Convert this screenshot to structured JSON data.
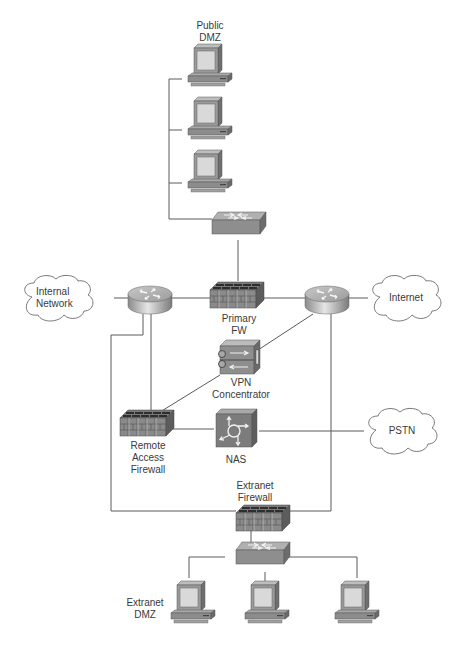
{
  "diagram": {
    "type": "network-topology",
    "colors": {
      "line": "#5a5a5a",
      "device_dark": "#6e6e6e",
      "device_mid": "#8c8c8c",
      "device_light": "#b8b8b8",
      "screen": "#d9d9d9",
      "cloud_stroke": "#6a6a6a"
    },
    "labels": {
      "public_dmz": "Public\nDMZ",
      "internal_network": "Internal\nNetwork",
      "internet": "Internet",
      "primary_fw": "Primary\nFW",
      "vpn_concentrator": "VPN\nConcentrator",
      "remote_access_firewall": "Remote\nAccess\nFirewall",
      "nas": "NAS",
      "pstn": "PSTN",
      "extranet_firewall": "Extranet\nFirewall",
      "extranet_dmz": "Extranet\nDMZ"
    },
    "nodes": [
      {
        "id": "public-dmz-pc-1",
        "kind": "workstation"
      },
      {
        "id": "public-dmz-pc-2",
        "kind": "workstation"
      },
      {
        "id": "public-dmz-pc-3",
        "kind": "workstation"
      },
      {
        "id": "public-dmz-switch",
        "kind": "switch"
      },
      {
        "id": "internal-network",
        "kind": "cloud",
        "label": "Internal Network"
      },
      {
        "id": "internal-router",
        "kind": "router"
      },
      {
        "id": "primary-fw",
        "kind": "firewall",
        "label": "Primary FW"
      },
      {
        "id": "internet-router",
        "kind": "router"
      },
      {
        "id": "internet",
        "kind": "cloud",
        "label": "Internet"
      },
      {
        "id": "vpn-concentrator",
        "kind": "vpn-concentrator",
        "label": "VPN Concentrator"
      },
      {
        "id": "remote-access-firewall",
        "kind": "firewall",
        "label": "Remote Access Firewall"
      },
      {
        "id": "nas",
        "kind": "access-server",
        "label": "NAS"
      },
      {
        "id": "pstn",
        "kind": "cloud",
        "label": "PSTN"
      },
      {
        "id": "extranet-firewall",
        "kind": "firewall",
        "label": "Extranet Firewall"
      },
      {
        "id": "extranet-switch",
        "kind": "switch"
      },
      {
        "id": "extranet-dmz-pc-1",
        "kind": "workstation"
      },
      {
        "id": "extranet-dmz-pc-2",
        "kind": "workstation"
      },
      {
        "id": "extranet-dmz-pc-3",
        "kind": "workstation"
      }
    ],
    "edges": [
      [
        "public-dmz-pc-1",
        "public-dmz-switch"
      ],
      [
        "public-dmz-pc-2",
        "public-dmz-switch"
      ],
      [
        "public-dmz-pc-3",
        "public-dmz-switch"
      ],
      [
        "public-dmz-switch",
        "primary-fw"
      ],
      [
        "internal-network",
        "internal-router"
      ],
      [
        "internal-router",
        "primary-fw"
      ],
      [
        "primary-fw",
        "internet-router"
      ],
      [
        "internet-router",
        "internet"
      ],
      [
        "internet-router",
        "vpn-concentrator"
      ],
      [
        "vpn-concentrator",
        "remote-access-firewall"
      ],
      [
        "internal-router",
        "remote-access-firewall"
      ],
      [
        "remote-access-firewall",
        "nas"
      ],
      [
        "nas",
        "pstn"
      ],
      [
        "internal-router",
        "extranet-firewall"
      ],
      [
        "internet-router",
        "extranet-firewall"
      ],
      [
        "extranet-firewall",
        "extranet-switch"
      ],
      [
        "extranet-switch",
        "extranet-dmz-pc-1"
      ],
      [
        "extranet-switch",
        "extranet-dmz-pc-2"
      ],
      [
        "extranet-switch",
        "extranet-dmz-pc-3"
      ]
    ]
  }
}
